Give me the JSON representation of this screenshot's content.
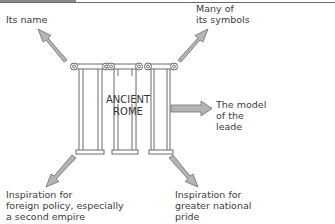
{
  "diagram": {
    "center": {
      "label": "ANCIENT\nROME"
    },
    "outcomes": [
      {
        "id": "its-name",
        "label": "Its name",
        "direction": "up-left"
      },
      {
        "id": "symbols",
        "label": "Many of\nits symbols",
        "direction": "up-right"
      },
      {
        "id": "leader-model",
        "label": "The model\nof the leade",
        "direction": "right"
      },
      {
        "id": "foreign-policy",
        "label": "Inspiration for\nforeign policy, especially\na second empire",
        "direction": "down-left"
      },
      {
        "id": "national-pride",
        "label": "Inspiration for\ngreater national\npride",
        "direction": "down-right"
      }
    ],
    "colors": {
      "arrow_fill": "#b4b4b4",
      "arrow_stroke": "#6e6e6e",
      "column_stroke": "#6a6a6a",
      "text": "#3c3c3c"
    }
  }
}
